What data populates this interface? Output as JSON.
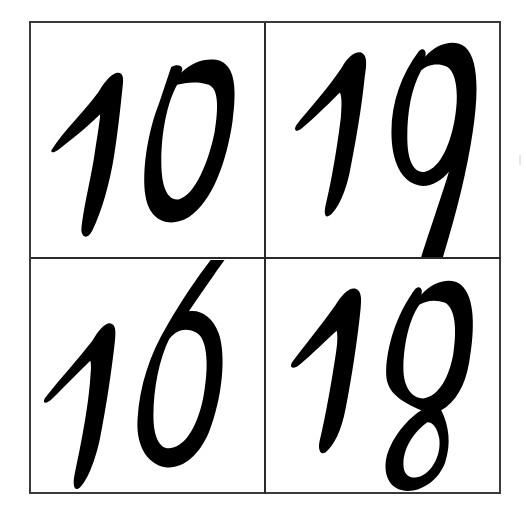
{
  "grid": {
    "rows": 2,
    "columns": 2,
    "border_color": "#333333",
    "ink_color": "#000000",
    "background": "#ffffff",
    "cells": [
      {
        "label": "10",
        "position": "top-left"
      },
      {
        "label": "19",
        "position": "top-right"
      },
      {
        "label": "16",
        "position": "bottom-left"
      },
      {
        "label": "18",
        "position": "bottom-right"
      }
    ]
  }
}
